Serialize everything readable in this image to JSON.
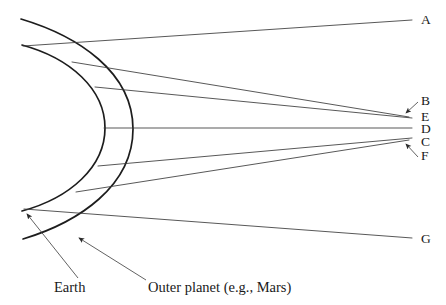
{
  "figure": {
    "background_color": "#ffffff",
    "ink_color": "#1a1a1a",
    "line_color": "#3a3a3a",
    "width": 446,
    "height": 305
  },
  "orbits": [
    {
      "name": "earth-orbit-arc",
      "label": "Earth",
      "role": "inner orbit arc",
      "apex_x": 105,
      "top_point": [
        22,
        45
      ],
      "bottom_point": [
        22,
        211
      ]
    },
    {
      "name": "outer-planet-orbit-arc",
      "label": "Outer planet (e.g., Mars)",
      "role": "outer orbit arc",
      "apex_x": 133,
      "top_point": [
        21,
        19
      ],
      "bottom_point": [
        23,
        239
      ]
    }
  ],
  "callouts": [
    {
      "id": "earth-callout",
      "text": "Earth",
      "text_x": 54,
      "text_y": 290,
      "arrow_from": [
        78,
        278
      ],
      "arrow_to": [
        25,
        213
      ]
    },
    {
      "id": "outer-planet-callout",
      "text": "Outer planet (e.g., Mars)",
      "text_x": 148,
      "text_y": 290,
      "arrow_from": [
        146,
        280
      ],
      "arrow_to": [
        77,
        237
      ]
    }
  ],
  "convergence_point": {
    "name": "line-of-sight-crossing",
    "x": 358,
    "y": 127
  },
  "sight_lines": [
    {
      "label": "A",
      "label_x": 421,
      "label_y": 24,
      "start": [
        23,
        46
      ],
      "end": [
        412,
        20
      ],
      "has_arrowhead": false
    },
    {
      "label": "B",
      "label_x": 421,
      "label_y": 105,
      "start": [
        72,
        62
      ],
      "end": [
        409,
        117
      ],
      "has_arrowhead": true,
      "arrow_from": [
        418,
        102
      ],
      "arrow_to": [
        405,
        114
      ]
    },
    {
      "label": "E",
      "label_x": 421,
      "label_y": 121,
      "start": [
        95,
        87
      ],
      "end": [
        412,
        118
      ],
      "has_arrowhead": false
    },
    {
      "label": "D",
      "label_x": 421,
      "label_y": 133,
      "start": [
        104,
        128
      ],
      "end": [
        412,
        128
      ],
      "has_arrowhead": false
    },
    {
      "label": "C",
      "label_x": 421,
      "label_y": 146,
      "start": [
        98,
        166
      ],
      "end": [
        412,
        138
      ],
      "has_arrowhead": false
    },
    {
      "label": "F",
      "label_x": 421,
      "label_y": 160,
      "start": [
        76,
        192
      ],
      "end": [
        409,
        140
      ],
      "has_arrowhead": true,
      "arrow_from": [
        418,
        156
      ],
      "arrow_to": [
        405,
        143
      ]
    },
    {
      "label": "G",
      "label_x": 421,
      "label_y": 243,
      "start": [
        24,
        209
      ],
      "end": [
        412,
        238
      ],
      "has_arrowhead": false
    }
  ]
}
